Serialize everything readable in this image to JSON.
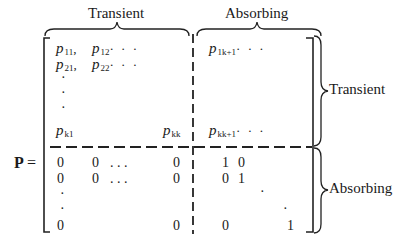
{
  "matrix": {
    "name": "P",
    "equals": "=",
    "column_groups": [
      {
        "label": "Transient"
      },
      {
        "label": "Absorbing"
      }
    ],
    "row_groups": [
      {
        "label": "Transient"
      },
      {
        "label": "Absorbing"
      }
    ],
    "top_left": {
      "r1c1": {
        "base": "p",
        "sub": "11",
        "suffix": ","
      },
      "r1c2": {
        "base": "p",
        "sub": "12",
        "suffix": "· · ·"
      },
      "r2c1": {
        "base": "p",
        "sub": "21",
        "suffix": ","
      },
      "r2c2": {
        "base": "p",
        "sub": "22",
        "suffix": "· · ·"
      },
      "vdots": [
        "·",
        "·",
        "·"
      ],
      "rk1": {
        "base": "p",
        "sub": "k1"
      },
      "rkk": {
        "base": "p",
        "sub": "kk"
      }
    },
    "top_right": {
      "r1": {
        "base": "p",
        "sub": "1k+1",
        "suffix": "· · ·"
      },
      "rk": {
        "base": "p",
        "sub": "kk+1",
        "suffix": "· · ·"
      }
    },
    "bottom_left": {
      "row1": [
        "0",
        "0",
        ". . .",
        "0"
      ],
      "row2": [
        "0",
        "0",
        ". . .",
        "0"
      ],
      "vdots": [
        "·",
        "·"
      ],
      "last": [
        "0",
        "0"
      ]
    },
    "bottom_right": {
      "row1": [
        "1",
        "0"
      ],
      "row2": [
        "0",
        "1"
      ],
      "ddots": [
        "·",
        "·"
      ],
      "last": [
        "0",
        "1"
      ]
    }
  }
}
